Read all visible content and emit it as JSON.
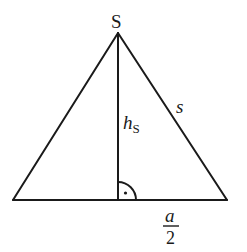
{
  "figure": {
    "type": "isosceles triangle with height",
    "colors": {
      "line": "#1a1a1a",
      "background": "#ffffff"
    },
    "labels": {
      "apex": "S",
      "height_main": "h",
      "height_sub": "S",
      "side": "s",
      "half_base_num": "a",
      "half_base_den": "2"
    },
    "right_angle_marker": "quarter-arc-with-dot"
  }
}
